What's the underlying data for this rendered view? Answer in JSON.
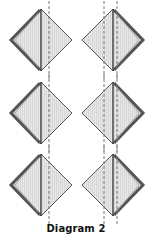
{
  "caption": "Diagram 2",
  "colors": {
    "fill": "#e6e6e6",
    "stripe": "#d2d2d2",
    "outline": "#555555",
    "thick_edge": "#555555",
    "fold_line": "#333333",
    "dashed_line": "#777777"
  },
  "rows": [
    {
      "left": {
        "thick_side": "left",
        "dashed_lines": 1
      },
      "right": {
        "thick_side": "right",
        "dashed_lines": 2
      }
    },
    {
      "left": {
        "thick_side": "left",
        "dashed_lines": 1
      },
      "right": {
        "thick_side": "right",
        "dashed_lines": 2
      }
    },
    {
      "left": {
        "thick_side": "left",
        "dashed_lines": 1
      },
      "right": {
        "thick_side": "right",
        "dashed_lines": 2
      }
    }
  ]
}
